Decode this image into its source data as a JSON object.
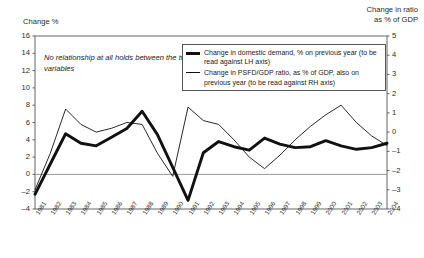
{
  "left_axis_title": "Change %",
  "right_axis_title": "Change in ratio\nas % of GDP",
  "annotation": "No relationship at all holds between the two variables",
  "legend": {
    "series1_label": "Change in domestic demand, % on previous year (to be read against LH axis)",
    "series2_label": "Change in PSFD/GDP ratio, as % of GDP, also on previous year (to be read against RH axis)"
  },
  "chart_data": {
    "type": "line",
    "title": "",
    "xlabel": "",
    "ylabel": "Change %",
    "y2label": "Change in ratio as % of GDP",
    "grid": false,
    "legend_position": "top-right",
    "x": [
      "1981",
      "1982",
      "1983",
      "1984",
      "1985",
      "1986",
      "1987",
      "1988",
      "1989",
      "1990",
      "1991",
      "1992",
      "1993",
      "1994",
      "1995",
      "1996",
      "1997",
      "1998",
      "1999",
      "2000",
      "2001",
      "2002",
      "2003",
      "2004"
    ],
    "ylim": [
      -4,
      16
    ],
    "yticks": [
      -4,
      -2,
      0,
      2,
      4,
      6,
      8,
      10,
      12,
      14,
      16
    ],
    "y2lim": [
      -4,
      5
    ],
    "y2ticks": [
      -4,
      -3,
      -2,
      -1,
      0,
      1,
      2,
      3,
      4,
      5
    ],
    "zero_line": 0,
    "series": [
      {
        "name": "Change in domestic demand, % on previous year",
        "axis": "left",
        "style": "thick",
        "color": "#111111",
        "values": [
          -2.3,
          1.2,
          4.7,
          3.6,
          3.3,
          4.3,
          5.3,
          7.3,
          4.6,
          0.8,
          -3.0,
          2.5,
          3.8,
          3.2,
          2.8,
          4.2,
          3.5,
          3.1,
          3.2,
          3.9,
          3.3,
          2.9,
          3.1,
          3.6
        ]
      },
      {
        "name": "Change in PSFD/GDP ratio, as % of GDP, also on previous year",
        "axis": "right",
        "style": "thin",
        "color": "#111111",
        "values": [
          -3.0,
          -1.1,
          1.2,
          0.4,
          0.0,
          0.2,
          0.5,
          0.4,
          -1.1,
          -2.3,
          1.3,
          0.6,
          0.4,
          -0.4,
          -1.3,
          -1.9,
          -1.2,
          -0.4,
          0.3,
          0.9,
          1.4,
          0.5,
          -0.2,
          -0.7
        ]
      }
    ]
  },
  "colors": {
    "frame": "#555555",
    "zero_line": "#9a9a9a",
    "line": "#111111"
  }
}
